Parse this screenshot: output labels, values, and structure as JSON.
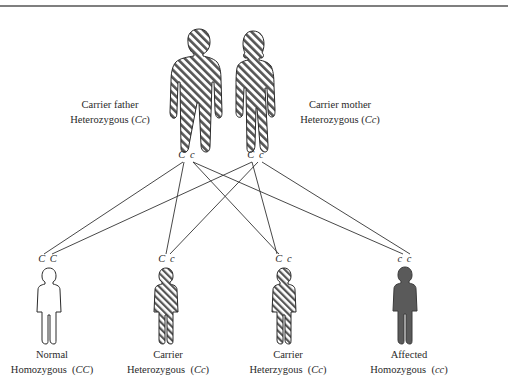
{
  "colors": {
    "outline": "#2a2a2a",
    "hatch": "#555555",
    "affected_fill": "#5a5a5a",
    "normal_fill": "#ffffff",
    "line": "#333333"
  },
  "parents": [
    {
      "id": "father",
      "line1": "Carrier father",
      "line2_prefix": "Heterozygous (",
      "genotype": "Cc",
      "line2_suffix": ")",
      "alleles": "C c",
      "pattern": "hatched"
    },
    {
      "id": "mother",
      "line1": "Carrier mother",
      "line2_prefix": "Heterozygous (",
      "genotype": "Cc",
      "line2_suffix": ")",
      "alleles": "C c",
      "pattern": "hatched"
    }
  ],
  "children": [
    {
      "id": "normal",
      "alleles": "C C",
      "line1": "Normal",
      "line2_prefix": "Homozygous  (",
      "genotype": "CC",
      "line2_suffix": ")",
      "pattern": "outline"
    },
    {
      "id": "carrier1",
      "alleles": "C c",
      "line1": "Carrier",
      "line2_prefix": "Heterozygous  (",
      "genotype": "Cc",
      "line2_suffix": ")",
      "pattern": "hatched"
    },
    {
      "id": "carrier2",
      "alleles": "C c",
      "line1": "Carrier",
      "line2_prefix": "Heterzygous  (",
      "genotype": "Cc",
      "line2_suffix": ")",
      "pattern": "hatched"
    },
    {
      "id": "affected",
      "alleles": "c c",
      "line1": "Affected",
      "line2_prefix": "Homozygous  (",
      "genotype": "cc",
      "line2_suffix": ")",
      "pattern": "solid"
    }
  ]
}
